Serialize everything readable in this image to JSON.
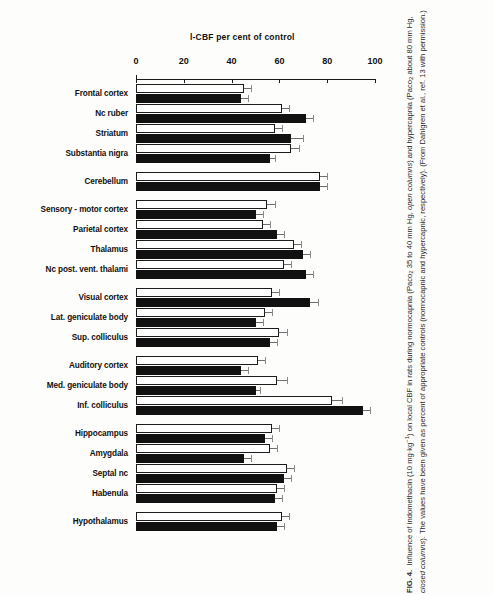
{
  "chart_data": {
    "type": "bar",
    "title": "l-CBF  per cent of control",
    "orientation": "horizontal",
    "xlabel": "l-CBF per cent of control",
    "ylabel": "",
    "xlim": [
      0,
      100
    ],
    "xticks": [
      0,
      20,
      40,
      60,
      80,
      100
    ],
    "grid": false,
    "legend_position": "none",
    "series": [
      {
        "name": "open columns",
        "description": "normocapnic control"
      },
      {
        "name": "closed columns",
        "description": "hypercapnic control"
      }
    ],
    "categories": [
      "Frontal cortex",
      "Nc ruber",
      "Striatum",
      "Substantia nigra",
      "Cerebellum",
      "Sensory - motor cortex",
      "Parietal cortex",
      "Thalamus",
      "Nc post. vent. thalami",
      "Visual cortex",
      "Lat. geniculate body",
      "Sup. colliculus",
      "Auditory cortex",
      "Med. geniculate body",
      "Inf. colliculus",
      "Hippocampus",
      "Amygdala",
      "Septal nc",
      "Habenula",
      "Hypothalamus"
    ],
    "groups": [
      {
        "label": "Frontal cortex",
        "open": 45,
        "open_err": 3,
        "closed": 44,
        "closed_err": 3,
        "gap_before": 0
      },
      {
        "label": "Nc ruber",
        "open": 61,
        "open_err": 3,
        "closed": 71,
        "closed_err": 3,
        "gap_before": 0
      },
      {
        "label": "Striatum",
        "open": 58,
        "open_err": 3,
        "closed": 65,
        "closed_err": 5,
        "gap_before": 0
      },
      {
        "label": "Substantia nigra",
        "open": 65,
        "open_err": 3,
        "closed": 56,
        "closed_err": 2,
        "gap_before": 0
      },
      {
        "label": "Cerebellum",
        "open": 77,
        "open_err": 3,
        "closed": 77,
        "closed_err": 3,
        "gap_before": 9
      },
      {
        "label": "Sensory - motor cortex",
        "open": 55,
        "open_err": 3,
        "closed": 50,
        "closed_err": 3,
        "gap_before": 9
      },
      {
        "label": "Parietal cortex",
        "open": 53,
        "open_err": 3,
        "closed": 59,
        "closed_err": 3,
        "gap_before": 0
      },
      {
        "label": "Thalamus",
        "open": 66,
        "open_err": 3,
        "closed": 70,
        "closed_err": 3,
        "gap_before": 0
      },
      {
        "label": "Nc post. vent. thalami",
        "open": 62,
        "open_err": 3,
        "closed": 71,
        "closed_err": 3,
        "gap_before": 0
      },
      {
        "label": "Visual cortex",
        "open": 57,
        "open_err": 3,
        "closed": 73,
        "closed_err": 3,
        "gap_before": 9
      },
      {
        "label": "Lat. geniculate body",
        "open": 54,
        "open_err": 3,
        "closed": 50,
        "closed_err": 3,
        "gap_before": 0
      },
      {
        "label": "Sup. colliculus",
        "open": 60,
        "open_err": 3,
        "closed": 56,
        "closed_err": 3,
        "gap_before": 0
      },
      {
        "label": "Auditory cortex",
        "open": 51,
        "open_err": 3,
        "closed": 44,
        "closed_err": 3,
        "gap_before": 9
      },
      {
        "label": "Med. geniculate body",
        "open": 59,
        "open_err": 4,
        "closed": 50,
        "closed_err": 2,
        "gap_before": 0
      },
      {
        "label": "Inf. colliculus",
        "open": 82,
        "open_err": 4,
        "closed": 95,
        "closed_err": 3,
        "gap_before": 0
      },
      {
        "label": "Hippocampus",
        "open": 57,
        "open_err": 3,
        "closed": 54,
        "closed_err": 3,
        "gap_before": 9
      },
      {
        "label": "Amygdala",
        "open": 56,
        "open_err": 3,
        "closed": 45,
        "closed_err": 3,
        "gap_before": 0
      },
      {
        "label": "Septal nc",
        "open": 63,
        "open_err": 3,
        "closed": 62,
        "closed_err": 3,
        "gap_before": 0
      },
      {
        "label": "Habenula",
        "open": 59,
        "open_err": 3,
        "closed": 58,
        "closed_err": 3,
        "gap_before": 0
      },
      {
        "label": "Hypothalamus",
        "open": 61,
        "open_err": 3,
        "closed": 59,
        "closed_err": 3,
        "gap_before": 9
      }
    ]
  },
  "caption": {
    "figure_number": "FIG. 4.",
    "text_part_1": "Influence of indomethacin (10 mg",
    "text_mid_dot": "·",
    "text_part_2": "kg",
    "text_exponent": "−1",
    "text_part_3": ") on local CBF in rats during normocapnia (Paco",
    "text_sub_1": "2",
    "text_part_4": " 35 to 40 mm Hg, ",
    "italic_open": "open columns",
    "text_part_5": ") and hypercapnia (Paco",
    "text_sub_2": "2",
    "text_part_6": " about 80 mm Hg, ",
    "italic_closed": "closed columns",
    "text_part_7": "). The values have been given as percent of appropriate controls (normocapnic and hypercapnic, respectively). (From Dahlgren et al., ref. 13 with permission.)"
  },
  "colors": {
    "open_bar_fill": "#ffffff",
    "open_bar_stroke": "#1c1c1c",
    "closed_bar_fill": "#111111",
    "axis": "#1a1a1a",
    "error_bar": "#6e6e6e",
    "background": "#fdfdfb"
  }
}
